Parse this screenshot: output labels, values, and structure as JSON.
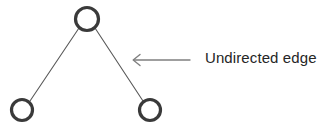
{
  "diagram": {
    "background_color": "#ffffff",
    "node_stroke_color": "#3a3a3a",
    "edge_color": "#595959",
    "arrow_color": "#808080",
    "label_color": "#262626",
    "nodes": [
      {
        "id": "top",
        "name": "node-top",
        "cx": 87,
        "cy": 19,
        "r": 11.5,
        "stroke_width": 3.2
      },
      {
        "id": "bottom-left",
        "name": "node-bottom-left",
        "cx": 22,
        "cy": 110,
        "r": 10.5,
        "stroke_width": 3.2
      },
      {
        "id": "bottom-right",
        "name": "node-bottom-right",
        "cx": 150,
        "cy": 110,
        "r": 10.5,
        "stroke_width": 3.2
      }
    ],
    "edges": [
      {
        "id": "edge-top-bottom-left",
        "name": "edge-top-bottom-left",
        "from": "top",
        "to": "bottom-left",
        "x1": 79,
        "y1": 28,
        "x2": 30,
        "y2": 101,
        "stroke_width": 1.1
      },
      {
        "id": "edge-top-bottom-right",
        "name": "edge-top-bottom-right",
        "from": "top",
        "to": "bottom-right",
        "x1": 95,
        "y1": 28,
        "x2": 143,
        "y2": 101,
        "stroke_width": 1.1
      }
    ],
    "annotation": {
      "text": "Undirected edge",
      "arrow": {
        "direction": "left",
        "tip_x": 133,
        "tail_x": 190,
        "y": 60,
        "head_size": 6,
        "stroke_width": 1.4
      }
    }
  }
}
